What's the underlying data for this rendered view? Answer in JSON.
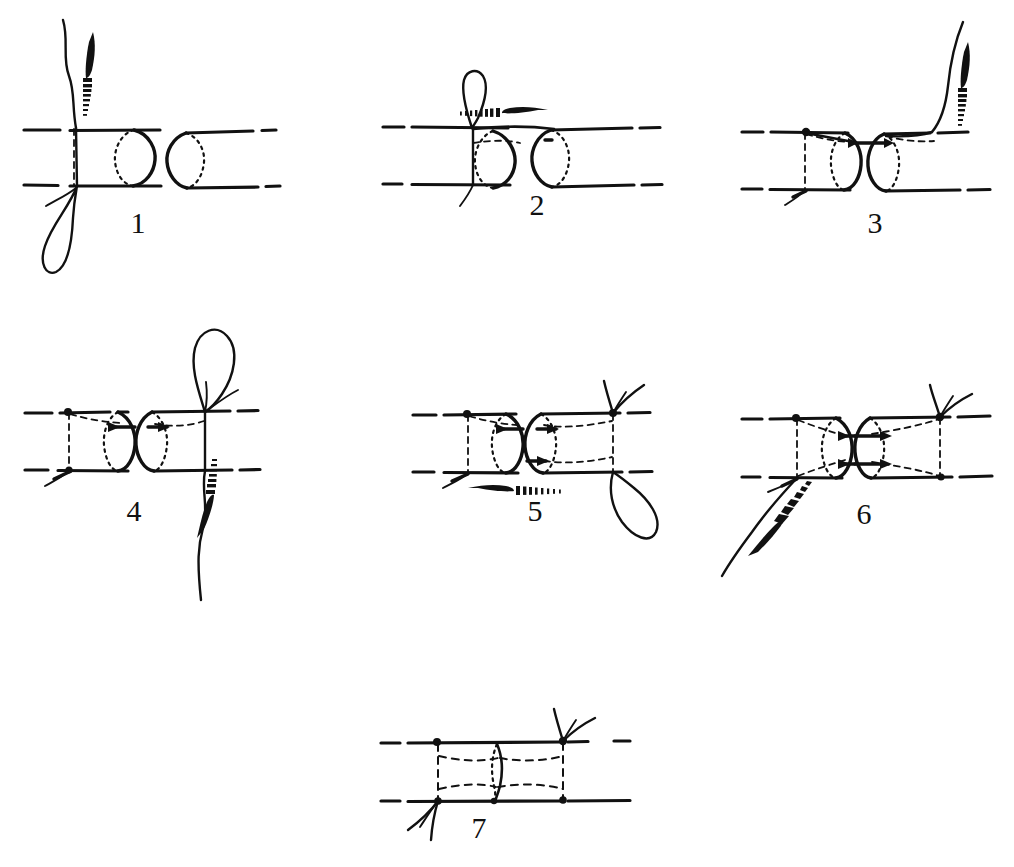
{
  "figure": {
    "background_color": "#ffffff",
    "ink_color": "#111111",
    "panel_count": 7,
    "panel_rows": [
      3,
      3,
      1
    ]
  },
  "panels": [
    {
      "id": "panel-1",
      "label": "1",
      "label_x": 138,
      "label_y": 233,
      "caption": "Needle passes through near wall of left tube end; thread loop hangs below, tube ends are separated",
      "needle": {
        "present": true,
        "direction": "up",
        "tip": "up"
      },
      "loop": {
        "present": true,
        "position": "below-left"
      },
      "knots": 0,
      "tube_gap": "wide"
    },
    {
      "id": "panel-2",
      "label": "2",
      "label_x": 537,
      "label_y": 215,
      "caption": "Needle driven horizontally to the right through the far tube end; loop of thread stands above the suture line",
      "needle": {
        "present": true,
        "direction": "right",
        "tip": "right"
      },
      "loop": {
        "present": true,
        "position": "above-left"
      },
      "knots": 0,
      "tube_gap": "medium"
    },
    {
      "id": "panel-3",
      "label": "3",
      "label_x": 875,
      "label_y": 233,
      "caption": "First stay suture tied on the left; needle and thread exit upward at the right, tube ends drawn closer",
      "needle": {
        "present": true,
        "direction": "up",
        "tip": "up"
      },
      "loop": {
        "present": false,
        "position": ""
      },
      "knots": 1,
      "tube_gap": "narrow"
    },
    {
      "id": "panel-4",
      "label": "4",
      "label_x": 134,
      "label_y": 521,
      "caption": "Second suture placed at the right; loop above and needle carried downward behind the tubes",
      "needle": {
        "present": true,
        "direction": "down",
        "tip": "down"
      },
      "loop": {
        "present": true,
        "position": "above-right"
      },
      "knots": 1,
      "tube_gap": "narrow"
    },
    {
      "id": "panel-5",
      "label": "5",
      "label_x": 535,
      "label_y": 521,
      "caption": "Needle runs leftward along the underside; lower loop of thread hangs at the right, upper knot tied",
      "needle": {
        "present": true,
        "direction": "left",
        "tip": "left"
      },
      "loop": {
        "present": true,
        "position": "below-right"
      },
      "knots": 1,
      "tube_gap": "narrow"
    },
    {
      "id": "panel-6",
      "label": "6",
      "label_x": 864,
      "label_y": 524,
      "caption": "Four sutures approximate the ends; needle and thread emerge at the lower left for the final knot",
      "needle": {
        "present": true,
        "direction": "down-left",
        "tip": "down-left"
      },
      "loop": {
        "present": false,
        "position": ""
      },
      "knots": 2,
      "tube_gap": "closed"
    },
    {
      "id": "panel-7",
      "label": "7",
      "label_x": 479,
      "label_y": 838,
      "caption": "Completed anastomosis: the two ends are joined, knots tied above right and below left, cut thread ends visible",
      "needle": {
        "present": false,
        "direction": "",
        "tip": ""
      },
      "loop": {
        "present": false,
        "position": ""
      },
      "knots": 2,
      "tube_gap": "joined"
    }
  ],
  "legend": {
    "needle_name": "curved-surgical-needle",
    "thread_name": "suture-thread",
    "tube_name": "tubular-structure-end",
    "knot_name": "suture-knot"
  }
}
